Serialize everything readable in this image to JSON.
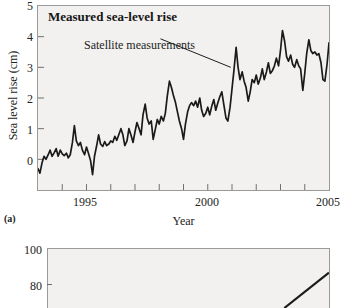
{
  "figure": {
    "panel_letter": "(a)"
  },
  "chart_data": {
    "type": "line",
    "title": "Measured sea-level rise",
    "xlabel": "Year",
    "ylabel": "Sea level rise (cm)",
    "xlim": [
      1993,
      2005
    ],
    "ylim": [
      -1,
      5
    ],
    "grid": false,
    "legend_position": "none",
    "annotations": [
      {
        "text": "Satellite measurements",
        "x_text": 1995.6,
        "y_text": 4.05,
        "x_point": 2000.95,
        "y_point": 3.0
      }
    ],
    "yticks": [
      5,
      4,
      3,
      2,
      1,
      0
    ],
    "ytick_labels": [
      "5",
      "4",
      "3",
      "2",
      "1",
      "0"
    ],
    "xticks": [
      1993,
      1994,
      1995,
      1996,
      1997,
      1998,
      1999,
      2000,
      2001,
      2002,
      2003,
      2004,
      2005
    ],
    "xtick_labels_major": [
      "1995",
      "2000",
      "2005"
    ],
    "xticks_major": [
      1995,
      2000,
      2005
    ],
    "series": [
      {
        "name": "Satellite measurements",
        "color": "#1a1a1a",
        "x": [
          1993.0,
          1993.08,
          1993.17,
          1993.25,
          1993.33,
          1993.42,
          1993.5,
          1993.58,
          1993.67,
          1993.75,
          1993.83,
          1993.92,
          1994.0,
          1994.08,
          1994.17,
          1994.25,
          1994.33,
          1994.42,
          1994.5,
          1994.58,
          1994.67,
          1994.75,
          1994.83,
          1994.92,
          1995.0,
          1995.08,
          1995.17,
          1995.25,
          1995.33,
          1995.42,
          1995.5,
          1995.58,
          1995.67,
          1995.75,
          1995.83,
          1995.92,
          1996.0,
          1996.08,
          1996.17,
          1996.25,
          1996.33,
          1996.42,
          1996.5,
          1996.58,
          1996.67,
          1996.75,
          1996.83,
          1996.92,
          1997.0,
          1997.08,
          1997.17,
          1997.25,
          1997.33,
          1997.42,
          1997.5,
          1997.58,
          1997.67,
          1997.75,
          1997.83,
          1997.92,
          1998.0,
          1998.08,
          1998.17,
          1998.25,
          1998.33,
          1998.42,
          1998.5,
          1998.58,
          1998.67,
          1998.75,
          1998.83,
          1998.92,
          1999.0,
          1999.08,
          1999.17,
          1999.25,
          1999.33,
          1999.42,
          1999.5,
          1999.58,
          1999.67,
          1999.75,
          1999.83,
          1999.92,
          2000.0,
          2000.08,
          2000.17,
          2000.25,
          2000.33,
          2000.42,
          2000.5,
          2000.58,
          2000.67,
          2000.75,
          2000.83,
          2000.92,
          2001.0,
          2001.08,
          2001.17,
          2001.25,
          2001.33,
          2001.42,
          2001.5,
          2001.58,
          2001.67,
          2001.75,
          2001.83,
          2001.92,
          2002.0,
          2002.08,
          2002.17,
          2002.25,
          2002.33,
          2002.42,
          2002.5,
          2002.58,
          2002.67,
          2002.75,
          2002.83,
          2002.92,
          2003.0,
          2003.08,
          2003.17,
          2003.25,
          2003.33,
          2003.42,
          2003.5,
          2003.58,
          2003.67,
          2003.75,
          2003.83,
          2003.92,
          2004.0,
          2004.08,
          2004.17,
          2004.25,
          2004.33,
          2004.42,
          2004.5,
          2004.58,
          2004.67,
          2004.75,
          2004.83,
          2004.92,
          2005.0
        ],
        "y": [
          -0.3,
          -0.45,
          -0.1,
          0.1,
          0.0,
          0.15,
          0.3,
          0.1,
          0.22,
          0.35,
          0.1,
          0.3,
          0.18,
          0.12,
          0.2,
          0.05,
          0.15,
          0.55,
          1.1,
          0.6,
          0.45,
          0.55,
          0.3,
          0.15,
          0.4,
          0.2,
          -0.05,
          -0.5,
          0.1,
          0.45,
          0.8,
          0.5,
          0.42,
          0.58,
          0.45,
          0.5,
          0.6,
          0.55,
          0.75,
          0.62,
          0.8,
          1.0,
          0.8,
          0.45,
          0.6,
          1.0,
          0.8,
          0.55,
          0.9,
          1.2,
          1.0,
          0.8,
          1.45,
          1.8,
          1.35,
          1.15,
          1.25,
          0.65,
          0.95,
          1.3,
          1.15,
          1.4,
          1.25,
          1.5,
          2.05,
          2.55,
          2.35,
          2.1,
          1.85,
          1.55,
          1.25,
          1.0,
          0.65,
          1.15,
          1.55,
          1.75,
          1.85,
          1.75,
          1.9,
          1.7,
          2.0,
          1.6,
          1.4,
          1.5,
          1.7,
          1.45,
          1.75,
          1.95,
          1.6,
          1.85,
          2.05,
          2.2,
          1.75,
          1.35,
          1.25,
          1.7,
          2.3,
          2.9,
          3.65,
          3.0,
          2.6,
          2.85,
          2.55,
          2.35,
          1.9,
          2.2,
          2.6,
          2.5,
          2.75,
          2.45,
          2.65,
          2.95,
          2.6,
          2.85,
          3.15,
          2.8,
          2.9,
          3.05,
          3.3,
          3.05,
          3.55,
          4.2,
          3.85,
          3.35,
          3.2,
          3.4,
          3.1,
          3.0,
          3.25,
          3.05,
          2.95,
          2.25,
          2.8,
          3.45,
          3.9,
          3.55,
          3.45,
          3.5,
          3.4,
          3.45,
          3.15,
          2.6,
          2.55,
          3.1,
          3.8
        ]
      }
    ]
  },
  "panel_b": {
    "yticks": [
      100,
      80
    ],
    "ytick_labels": [
      "100",
      "80"
    ],
    "ylim": [
      70,
      104
    ],
    "series_note": "partial-rising-line"
  }
}
